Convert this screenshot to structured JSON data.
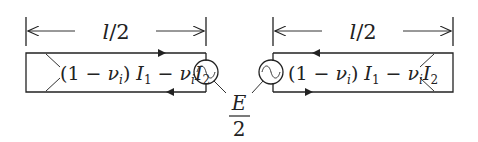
{
  "diagram": {
    "left_section": {
      "dimension_label": "l/2",
      "current_expression": {
        "open": "(1 − ",
        "nu": "ν",
        "nu_sub": "i",
        "close": ") ",
        "I1": "I",
        "I1_sub": "1",
        "minus": " − ",
        "nu2": "ν",
        "nu2_sub": "i",
        "I2": "I",
        "I2_sub": "2"
      },
      "arrows": {
        "top": "left",
        "bottom": "right"
      },
      "source": "ac-source"
    },
    "right_section": {
      "dimension_label": "l/2",
      "current_expression": {
        "open": "(1 − ",
        "nu": "ν",
        "nu_sub": "i",
        "close": ") ",
        "I1": "I",
        "I1_sub": "1",
        "minus": " − ",
        "nu2": "ν",
        "nu2_sub": "i",
        "I2": "I",
        "I2_sub": "2"
      },
      "arrows": {
        "top": "left",
        "bottom": "right"
      },
      "source": "ac-source"
    },
    "source_label": {
      "numerator": "E",
      "denominator": "2"
    }
  }
}
